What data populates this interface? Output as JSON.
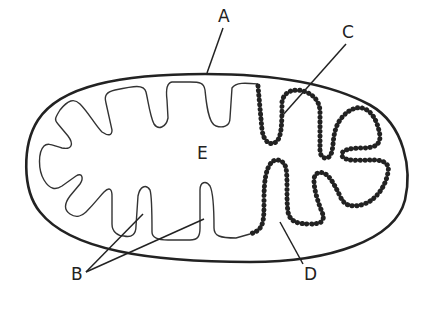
{
  "diagram": {
    "labels": {
      "A": "A",
      "B": "B",
      "C": "C",
      "D": "D",
      "E": "E"
    },
    "label_targets": {
      "A": "outer membrane",
      "B": "cristae (inner membrane folds)",
      "C": "inner membrane with particles",
      "D": "inner membrane with particles",
      "E": "matrix"
    },
    "colors": {
      "line": "#222222",
      "background": "#ffffff"
    }
  }
}
